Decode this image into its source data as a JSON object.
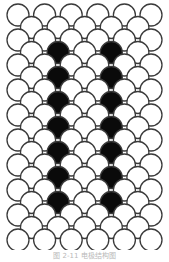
{
  "diagram": {
    "type": "hexagonal-circle-array",
    "stroke_color": "#3a3a3a",
    "fill_color": "#ffffff",
    "active_fill_color": "#0a0a0a",
    "circle_radius": 11,
    "row_spacing": 12.5,
    "col_spacing": 26.6,
    "first_row_y": 15,
    "wide_row_start_x": 18,
    "narrow_row_start_x": 31.5,
    "wide_row_count": 6,
    "narrow_row_count": 5,
    "total_rows": 19,
    "filled": [
      {
        "row": 3,
        "col": 1
      },
      {
        "row": 3,
        "col": 3
      },
      {
        "row": 5,
        "col": 1
      },
      {
        "row": 5,
        "col": 3
      },
      {
        "row": 7,
        "col": 1
      },
      {
        "row": 7,
        "col": 3
      },
      {
        "row": 9,
        "col": 1
      },
      {
        "row": 9,
        "col": 3
      },
      {
        "row": 11,
        "col": 1
      },
      {
        "row": 11,
        "col": 3
      },
      {
        "row": 13,
        "col": 1
      },
      {
        "row": 13,
        "col": 3
      },
      {
        "row": 15,
        "col": 1
      },
      {
        "row": 15,
        "col": 3
      }
    ]
  },
  "caption": "图 2-11   电极结构图"
}
